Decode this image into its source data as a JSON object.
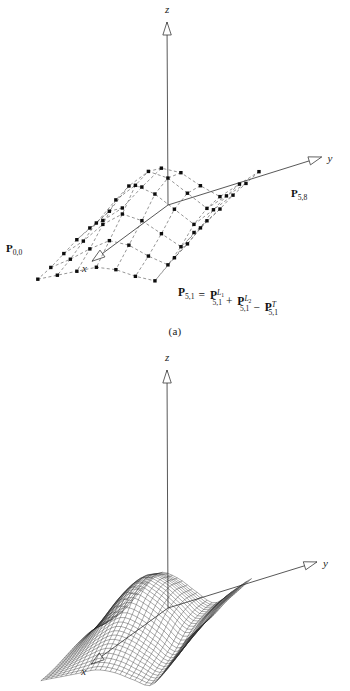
{
  "figure": {
    "background_color": "#ffffff",
    "ink_color": "#111111",
    "mesh_color": "#2b2b2b",
    "dash_color": "#555555",
    "axis_color": "#3a3a3a"
  },
  "panels": [
    {
      "id": "a",
      "caption": "(a)",
      "kind": "control-net",
      "axes": {
        "x_label": "x",
        "y_label": "y",
        "z_label": "z",
        "arrowhead_style": "hollow-outline"
      },
      "labels": [
        {
          "name": "p-0-0",
          "base": "P",
          "sub": "0,0",
          "sup": "",
          "supsub": ""
        },
        {
          "name": "p-5-8",
          "base": "P",
          "sub": "5,8",
          "sup": "",
          "supsub": ""
        }
      ],
      "formula": {
        "text": "P5,1 = P5,1^L1 + P5,1^L2 - P5,1^T",
        "terms": [
          {
            "base": "P",
            "sub": "5,1",
            "sup": "",
            "supsub": ""
          },
          {
            "op": "="
          },
          {
            "base": "P",
            "sub": "5,1",
            "sup": "L",
            "supsub": "1"
          },
          {
            "op": "+"
          },
          {
            "base": "P",
            "sub": "5,1",
            "sup": "L",
            "supsub": "2"
          },
          {
            "op": "−"
          },
          {
            "base": "P",
            "sub": "5,1",
            "sup": "T",
            "supsub": ""
          }
        ]
      },
      "marker_style": "filled-square",
      "line_style": "dashed"
    },
    {
      "id": "b",
      "caption": "(b)",
      "kind": "wireframe-surface",
      "axes": {
        "x_label": "x",
        "y_label": "y",
        "z_label": "z",
        "arrowhead_style": "hollow-outline"
      },
      "mesh": {
        "u_lines": 30,
        "v_lines": 30,
        "line_style": "solid"
      }
    }
  ],
  "chart_data": {
    "type": "surface",
    "title": "",
    "xlabel": "x",
    "ylabel": "y",
    "zlabel": "z",
    "control_net": {
      "rows": 6,
      "cols": 9,
      "row_index_range": [
        0,
        5
      ],
      "col_index_range": [
        0,
        8
      ],
      "corner_labels": {
        "near": "P_{0,0}",
        "far": "P_{5,8}"
      },
      "heights": [
        [
          0.05,
          0.2,
          0.55,
          0.85,
          0.6,
          0.15,
          -0.25,
          -0.1,
          0.05
        ],
        [
          0.1,
          0.35,
          0.8,
          1.0,
          0.7,
          0.2,
          -0.3,
          -0.15,
          0.0
        ],
        [
          0.05,
          0.3,
          0.7,
          0.9,
          0.55,
          0.05,
          -0.45,
          -0.25,
          -0.05
        ],
        [
          -0.05,
          0.1,
          0.35,
          0.45,
          0.15,
          -0.3,
          -0.75,
          -0.45,
          -0.15
        ],
        [
          -0.15,
          -0.1,
          0.0,
          0.05,
          -0.2,
          -0.6,
          -0.95,
          -0.6,
          -0.2
        ],
        [
          -0.2,
          -0.25,
          -0.3,
          -0.35,
          -0.55,
          -0.85,
          -1.1,
          -0.7,
          -0.25
        ]
      ]
    },
    "surface_mesh": {
      "u_divisions": 30,
      "v_divisions": 30,
      "shape": "saddle-with-ridge-and-valley"
    }
  }
}
